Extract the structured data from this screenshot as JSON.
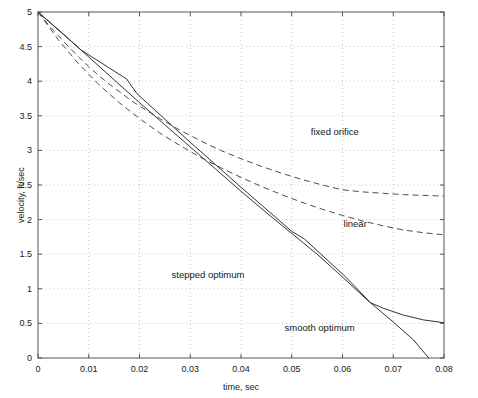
{
  "chart_data": {
    "type": "line",
    "title": "",
    "xlabel": "time, sec",
    "ylabel": "velocity, ft/sec",
    "xlim": [
      0,
      0.08
    ],
    "ylim": [
      0,
      5
    ],
    "xticks": [
      "0",
      "0.01",
      "0.02",
      "0.03",
      "0.04",
      "0.05",
      "0.06",
      "0.07",
      "0.08"
    ],
    "xtick_values": [
      0,
      0.01,
      0.02,
      0.03,
      0.04,
      0.05,
      0.06,
      0.07,
      0.08
    ],
    "yticks": [
      "0",
      "0.5",
      "1",
      "1.5",
      "2",
      "2.5",
      "3",
      "3.5",
      "4",
      "4.5",
      "5"
    ],
    "ytick_values": [
      0,
      0.5,
      1,
      1.5,
      2,
      2.5,
      3,
      3.5,
      4,
      4.5,
      5
    ],
    "grid": true,
    "grid_style": "dotted",
    "legend_position": "inline-annotations",
    "series": [
      {
        "name": "fixed orifice",
        "style": "dashed",
        "color": "#4d4d4d",
        "label_x": 0.0585,
        "label_y": 3.28,
        "points": [
          [
            0.0,
            5.0
          ],
          [
            0.002,
            4.82
          ],
          [
            0.004,
            4.66
          ],
          [
            0.006,
            4.5
          ],
          [
            0.008,
            4.35
          ],
          [
            0.01,
            4.21
          ],
          [
            0.012,
            4.08
          ],
          [
            0.014,
            3.96
          ],
          [
            0.016,
            3.85
          ],
          [
            0.018,
            3.74
          ],
          [
            0.02,
            3.64
          ],
          [
            0.024,
            3.46
          ],
          [
            0.028,
            3.29
          ],
          [
            0.032,
            3.14
          ],
          [
            0.036,
            3.0
          ],
          [
            0.04,
            2.88
          ],
          [
            0.044,
            2.77
          ],
          [
            0.048,
            2.67
          ],
          [
            0.052,
            2.58
          ],
          [
            0.056,
            2.5
          ],
          [
            0.06,
            2.43
          ],
          [
            0.064,
            2.4
          ],
          [
            0.068,
            2.38
          ],
          [
            0.072,
            2.36
          ],
          [
            0.076,
            2.35
          ],
          [
            0.08,
            2.34
          ]
        ]
      },
      {
        "name": "linear",
        "style": "dashed",
        "color": "#4d4d4d",
        "label_x": 0.0625,
        "label_y": 1.95,
        "points": [
          [
            0.0,
            5.0
          ],
          [
            0.004,
            4.6
          ],
          [
            0.008,
            4.25
          ],
          [
            0.012,
            3.95
          ],
          [
            0.016,
            3.69
          ],
          [
            0.02,
            3.46
          ],
          [
            0.024,
            3.25
          ],
          [
            0.028,
            3.07
          ],
          [
            0.032,
            2.9
          ],
          [
            0.036,
            2.75
          ],
          [
            0.04,
            2.61
          ],
          [
            0.044,
            2.48
          ],
          [
            0.048,
            2.36
          ],
          [
            0.052,
            2.25
          ],
          [
            0.056,
            2.15
          ],
          [
            0.06,
            2.06
          ],
          [
            0.064,
            1.98
          ],
          [
            0.068,
            1.91
          ],
          [
            0.072,
            1.85
          ],
          [
            0.076,
            1.81
          ],
          [
            0.08,
            1.78
          ]
        ]
      },
      {
        "name": "stepped optimum",
        "style": "solid",
        "color": "#333333",
        "label_x": 0.0335,
        "label_y": 1.22,
        "points": [
          [
            0.0,
            5.0
          ],
          [
            0.0085,
            4.45
          ],
          [
            0.0175,
            4.03
          ],
          [
            0.0195,
            3.82
          ],
          [
            0.0295,
            3.15
          ],
          [
            0.0395,
            2.5
          ],
          [
            0.05,
            1.83
          ],
          [
            0.0525,
            1.72
          ],
          [
            0.0605,
            1.18
          ],
          [
            0.0655,
            0.8
          ],
          [
            0.068,
            0.72
          ],
          [
            0.072,
            0.62
          ],
          [
            0.076,
            0.55
          ],
          [
            0.08,
            0.51
          ]
        ]
      },
      {
        "name": "smooth optimum",
        "style": "solid",
        "color": "#333333",
        "label_x": 0.0555,
        "label_y": 0.45,
        "points": [
          [
            0.0,
            5.0
          ],
          [
            0.005,
            4.68
          ],
          [
            0.01,
            4.35
          ],
          [
            0.015,
            4.02
          ],
          [
            0.02,
            3.69
          ],
          [
            0.025,
            3.37
          ],
          [
            0.03,
            3.05
          ],
          [
            0.035,
            2.73
          ],
          [
            0.04,
            2.41
          ],
          [
            0.045,
            2.1
          ],
          [
            0.05,
            1.8
          ],
          [
            0.055,
            1.5
          ],
          [
            0.06,
            1.17
          ],
          [
            0.065,
            0.83
          ],
          [
            0.07,
            0.52
          ],
          [
            0.074,
            0.26
          ],
          [
            0.077,
            0.0
          ]
        ]
      }
    ]
  },
  "axes": {
    "frame_color": "#555555",
    "grid_color": "#c8c8c8",
    "background": "#ffffff"
  }
}
